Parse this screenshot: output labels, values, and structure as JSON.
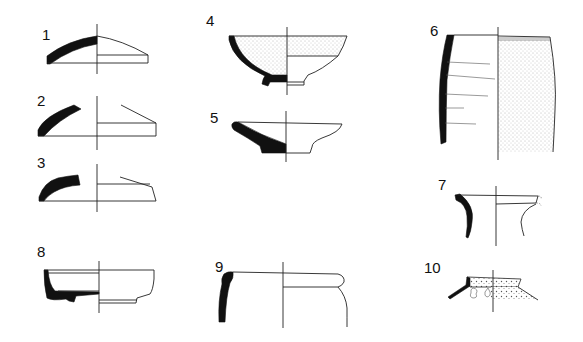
{
  "plate": {
    "type": "pottery profile drawings",
    "figures": [
      {
        "label": "1",
        "form": "lid"
      },
      {
        "label": "2",
        "form": "lid"
      },
      {
        "label": "3",
        "form": "lid"
      },
      {
        "label": "4",
        "form": "footed bowl (slipped interior/exterior)"
      },
      {
        "label": "5",
        "form": "shallow dish"
      },
      {
        "label": "6",
        "form": "storage jar body (stippled exterior)"
      },
      {
        "label": "7",
        "form": "jar neck/rim"
      },
      {
        "label": "8",
        "form": "bowl with ring base"
      },
      {
        "label": "9",
        "form": "jar rim"
      },
      {
        "label": "10",
        "form": "vessel rim with applied lugs"
      }
    ]
  }
}
